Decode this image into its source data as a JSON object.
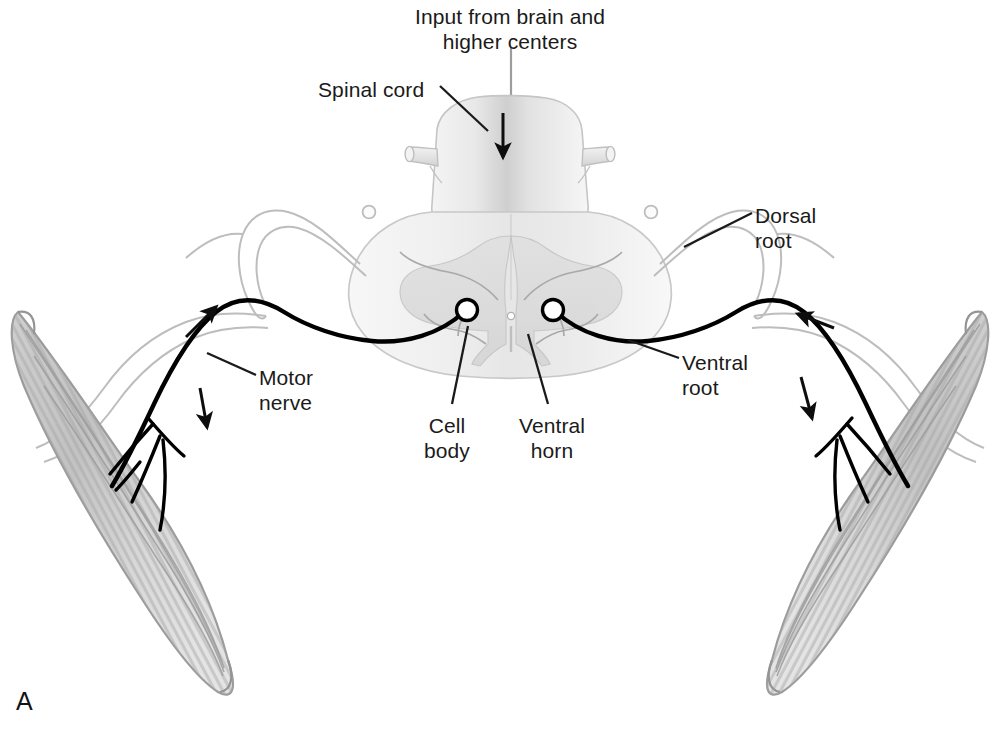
{
  "figure": {
    "panel_letter": "A",
    "background_color": "#ffffff",
    "ink_color": "#1a1a1a",
    "nerve_color": "#000000",
    "sheath_color": "#b9b9b9",
    "cord_fill": "#ededed",
    "cord_stroke": "#c3c3c3",
    "gray_matter": "#dcdcdc",
    "muscle_fill": "#d2d2d2",
    "muscle_stripe": "#a8a8a8",
    "muscle_outline": "#9a9a9a"
  },
  "labels": {
    "input": {
      "text": "Input from brain and\nhigher centers",
      "x": 510,
      "y": 4,
      "align": "center"
    },
    "spinal_cord": {
      "text": "Spinal cord",
      "x": 318,
      "y": 77,
      "align": "left"
    },
    "dorsal_root": {
      "text": "Dorsal\nroot",
      "x": 755,
      "y": 203,
      "align": "left"
    },
    "ventral_root": {
      "text": "Ventral\nroot",
      "x": 682,
      "y": 350,
      "align": "left"
    },
    "motor_nerve": {
      "text": "Motor\nnerve",
      "x": 259,
      "y": 365,
      "align": "left"
    },
    "cell_body": {
      "text": "Cell\nbody",
      "x": 447,
      "y": 413,
      "align": "center"
    },
    "ventral_horn": {
      "text": "Ventral\nhorn",
      "x": 552,
      "y": 413,
      "align": "center"
    }
  },
  "structures": {
    "spinal_cord_name": "spinal-cord-cross-section",
    "left_muscle_name": "skeletal-muscle-left",
    "right_muscle_name": "skeletal-muscle-right",
    "dorsal_root_ganglion_left": "dorsal-root-ganglion-left",
    "dorsal_root_ganglion_right": "dorsal-root-ganglion-right",
    "cell_body_left": "motor-neuron-cell-body-left",
    "cell_body_right": "motor-neuron-cell-body-right",
    "central_canal": "central-canal"
  },
  "arrows": {
    "descending_input": "arrow-descending-input",
    "left_afferent": "arrow-left-afferent-up",
    "left_efferent": "arrow-left-efferent-down",
    "right_afferent": "arrow-right-afferent-up",
    "right_efferent": "arrow-right-efferent-down"
  }
}
